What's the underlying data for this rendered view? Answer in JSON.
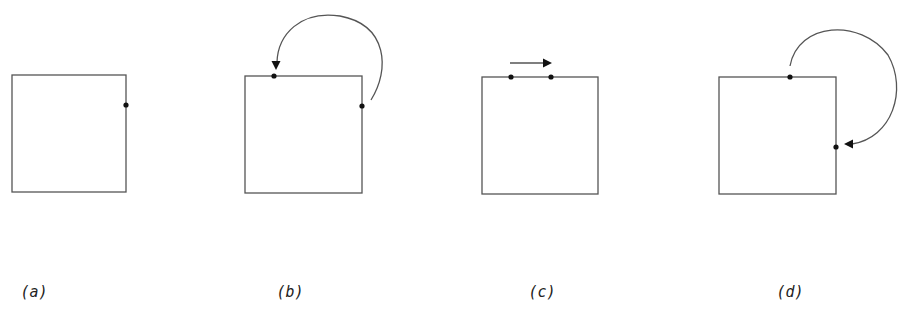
{
  "panels": [
    {
      "id": "a",
      "label": "(a)",
      "square": {
        "x": 12,
        "y": 75,
        "w": 114,
        "h": 117
      },
      "dots": [
        {
          "x": 126,
          "y": 105
        }
      ],
      "arrow": null
    },
    {
      "id": "b",
      "label": "(b)",
      "square": {
        "x": 245,
        "y": 76,
        "w": 117,
        "h": 117
      },
      "dots": [
        {
          "x": 274,
          "y": 76
        },
        {
          "x": 362,
          "y": 106
        }
      ],
      "arrow": {
        "type": "arc",
        "path": "M 371 100 C 390 70, 388 25, 340 16 C 300 10, 278 35, 277 62",
        "head": {
          "x": 276,
          "y": 70,
          "dir": "down"
        }
      }
    },
    {
      "id": "c",
      "label": "(c)",
      "square": {
        "x": 482,
        "y": 77,
        "w": 116,
        "h": 117
      },
      "dots": [
        {
          "x": 511,
          "y": 77
        },
        {
          "x": 551,
          "y": 77
        }
      ],
      "arrow": {
        "type": "straight",
        "path": "M 510 63 L 545 63",
        "head": {
          "x": 552,
          "y": 63,
          "dir": "right"
        }
      }
    },
    {
      "id": "d",
      "label": "(d)",
      "square": {
        "x": 719,
        "y": 77,
        "w": 117,
        "h": 117
      },
      "dots": [
        {
          "x": 790,
          "y": 77
        },
        {
          "x": 836,
          "y": 147
        }
      ],
      "arrow": {
        "type": "arc",
        "path": "M 790 66 C 798 22, 860 18, 888 55 C 908 90, 892 138, 852 144",
        "head": {
          "x": 844,
          "y": 144,
          "dir": "left"
        }
      }
    }
  ],
  "style": {
    "stroke": "#555555",
    "dot": "#111111",
    "arrowhead": "#111111"
  }
}
